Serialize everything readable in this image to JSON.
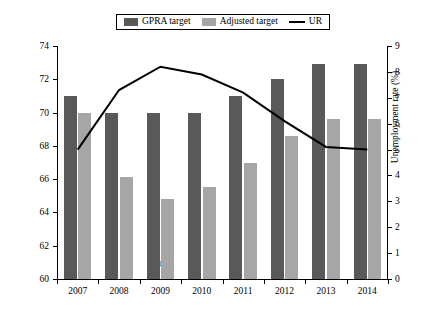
{
  "chart_data": {
    "type": "bar",
    "title": "",
    "categories": [
      "2007",
      "2008",
      "2009",
      "2010",
      "2011",
      "2012",
      "2013",
      "2014"
    ],
    "xlabel": "Year",
    "ylabel": "Entered employment rate (%)",
    "ylabel_secondary": "Unemployment rate (%)",
    "ylim": [
      60,
      74
    ],
    "ylim_secondary": [
      0,
      9
    ],
    "yticks": [
      "60",
      "62",
      "64",
      "66",
      "68",
      "70",
      "72",
      "74"
    ],
    "yticks_secondary": [
      "0",
      "1",
      "2",
      "3",
      "4",
      "5",
      "6",
      "7",
      "8",
      "9"
    ],
    "grid": false,
    "legend_position": "top-center",
    "series": [
      {
        "name": "GPRA target",
        "type": "bar",
        "axis": "left",
        "color": "#595959",
        "values": [
          71.0,
          70.0,
          70.0,
          70.0,
          71.0,
          72.0,
          72.9,
          72.9
        ]
      },
      {
        "name": "Adjusted target",
        "type": "bar",
        "axis": "left",
        "color": "#a6a6a6",
        "values": [
          70.0,
          66.1,
          64.8,
          65.5,
          67.0,
          68.6,
          69.6,
          69.6
        ]
      },
      {
        "name": "UR",
        "type": "line",
        "axis": "right",
        "color": "#000000",
        "values": [
          5.0,
          7.3,
          8.2,
          7.9,
          7.2,
          6.1,
          5.1,
          5.0
        ]
      }
    ]
  },
  "legend": {
    "items": [
      {
        "label": "GPRA target",
        "swatch": "dark-gray-square"
      },
      {
        "label": "Adjusted target",
        "swatch": "light-gray-square"
      },
      {
        "label": "UR",
        "swatch": "black-line"
      }
    ]
  }
}
